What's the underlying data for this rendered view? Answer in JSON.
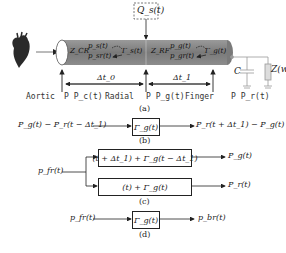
{
  "panel_a": {
    "caption": "(a)",
    "source_label": "Q_s(t)",
    "segment1": {
      "impedance": "Z_CR",
      "forward_wave": "p_s(t)",
      "backward_wave": "p_sr(t)",
      "reflection": "Γ_s(t)",
      "delay": "Δt_0"
    },
    "segment2": {
      "impedance": "Z_RF",
      "forward_wave": "p_g(t)",
      "backward_wave": "p_gr(t)",
      "reflection": "Γ_g(t)",
      "delay": "Δt_1"
    },
    "terminal": {
      "capacitor": "C",
      "impedance": "Z(w)"
    },
    "sites": [
      {
        "name": "Aortic",
        "pressure": "P P_c(t)"
      },
      {
        "name": "Radial",
        "pressure": "P P_g(t)"
      },
      {
        "name": "Finger",
        "pressure": "P P_r(t)"
      }
    ]
  },
  "panel_b": {
    "caption": "(b)",
    "input": "P_g(t) − P_r(t − Δt_1)",
    "block": "Γ_g(t)",
    "output": "P_r(t + Δt_1) − P_g(t)"
  },
  "panel_c": {
    "caption": "(c)",
    "input": "p_fr(t)",
    "block_top": "(t + Δt_1) + Γ_g(t − Δt_1)",
    "output_top": "P_g(t)",
    "block_bottom": "(t) + Γ_g(t)",
    "output_bottom": "P_r(t)"
  },
  "panel_d": {
    "caption": "(d)",
    "input": "p_fr(t)",
    "block": "Γ_g(t)",
    "output": "p_br(t)"
  }
}
